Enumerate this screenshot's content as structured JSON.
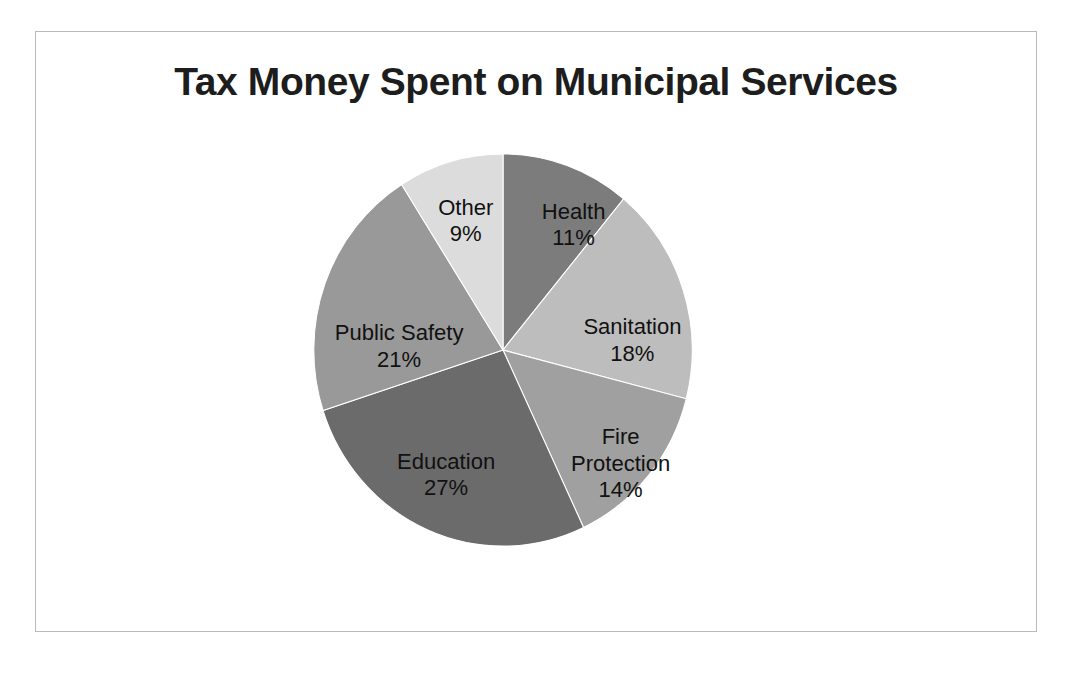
{
  "chart_data": {
    "type": "pie",
    "title": "Tax Money Spent on Municipal Services",
    "xlabel": "",
    "ylabel": "",
    "legend": "none",
    "grid": false,
    "units": "percent",
    "value_label_format": "{value}%",
    "start_angle_deg": 0,
    "direction": "clockwise",
    "categories": [
      "Health",
      "Sanitation",
      "Fire Protection",
      "Education",
      "Public Safety",
      "Other"
    ],
    "values": [
      11,
      18,
      14,
      27,
      21,
      9
    ],
    "total": 100,
    "colors": [
      "#7c7c7c",
      "#bdbdbd",
      "#a0a0a0",
      "#6b6b6b",
      "#999999",
      "#dcdcdc"
    ],
    "slices": [
      {
        "label": "Health",
        "value": 11,
        "value_text": "11%",
        "color": "#7c7c7c",
        "label_lines": [
          "Health",
          "11%"
        ],
        "label_x": 72,
        "label_y": -140
      },
      {
        "label": "Sanitation",
        "value": 18,
        "value_text": "18%",
        "color": "#bdbdbd",
        "label_lines": [
          "Sanitation",
          "18%"
        ],
        "label_x": 132,
        "label_y": -22
      },
      {
        "label": "Fire Protection",
        "value": 14,
        "value_text": "14%",
        "color": "#a0a0a0",
        "label_lines": [
          "Fire",
          "Protection",
          "14%"
        ],
        "label_x": 120,
        "label_y": 90
      },
      {
        "label": "Education",
        "value": 27,
        "value_text": "27%",
        "color": "#6b6b6b",
        "label_lines": [
          "Education",
          "27%"
        ],
        "label_x": -58,
        "label_y": 115
      },
      {
        "label": "Public Safety",
        "value": 21,
        "value_text": "21%",
        "color": "#999999",
        "label_lines": [
          "Public Safety",
          "21%"
        ],
        "label_x": -106,
        "label_y": -16
      },
      {
        "label": "Other",
        "value": 9,
        "value_text": "9%",
        "color": "#dcdcdc",
        "label_lines": [
          "Other",
          "9%"
        ],
        "label_x": -38,
        "label_y": -144
      }
    ]
  },
  "figure": {
    "background_color": "#ffffff",
    "frame_color": "#b9b9b9",
    "title": "Tax Money Spent on Municipal Services"
  }
}
